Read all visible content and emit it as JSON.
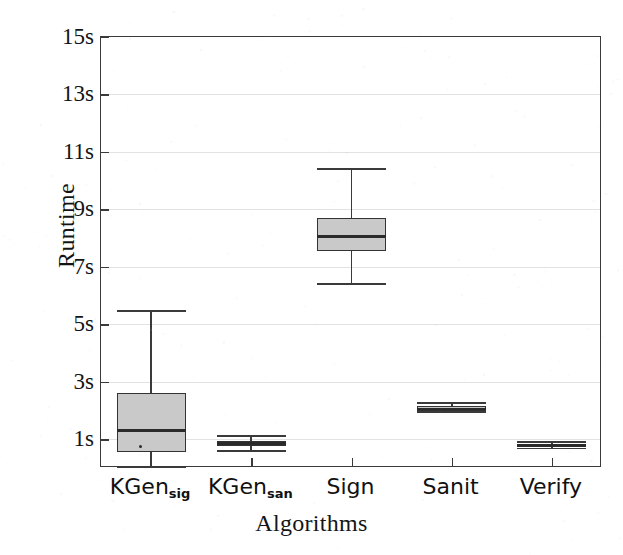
{
  "chart_data": {
    "type": "box",
    "title": "",
    "xlabel": "Algorithms",
    "ylabel": "Runtime",
    "categories": [
      "KGen_sig",
      "KGen_san",
      "Sign",
      "Sanit",
      "Verify"
    ],
    "category_labels": [
      {
        "base": "KGen",
        "sub": "sig"
      },
      {
        "base": "KGen",
        "sub": "san"
      },
      {
        "base": "Sign",
        "sub": ""
      },
      {
        "base": "Sanit",
        "sub": ""
      },
      {
        "base": "Verify",
        "sub": ""
      }
    ],
    "ylim": [
      0.0,
      15.0
    ],
    "yticks": [
      1,
      3,
      5,
      7,
      9,
      11,
      13,
      15
    ],
    "ytick_labels": [
      "1s",
      "3s",
      "5s",
      "7s",
      "9s",
      "11s",
      "13s",
      "15s"
    ],
    "grid": true,
    "legend": "none",
    "units": "seconds",
    "boxes": [
      {
        "category": "KGen_sig",
        "whisker_low": 0.05,
        "q1": 0.55,
        "median": 1.3,
        "q3": 2.6,
        "whisker_high": 5.45,
        "outliers": [
          0.75
        ]
      },
      {
        "category": "KGen_san",
        "whisker_low": 0.6,
        "q1": 0.75,
        "median": 0.85,
        "q3": 0.95,
        "whisker_high": 1.1,
        "outliers": []
      },
      {
        "category": "Sign",
        "whisker_low": 6.4,
        "q1": 7.55,
        "median": 8.05,
        "q3": 8.7,
        "whisker_high": 10.4,
        "outliers": []
      },
      {
        "category": "Sanit",
        "whisker_low": 1.95,
        "q1": 2.0,
        "median": 2.05,
        "q3": 2.15,
        "whisker_high": 2.25,
        "outliers": []
      },
      {
        "category": "Verify",
        "whisker_low": 0.68,
        "q1": 0.72,
        "median": 0.78,
        "q3": 0.84,
        "whisker_high": 0.9,
        "outliers": []
      }
    ],
    "colors": {
      "box_fill": "#c9c9c9",
      "box_edge": "#333333",
      "median": "#2a2a2a",
      "whisker": "#3a3a3a",
      "grid": "#e2e2e2",
      "axis": "#3a3a3a",
      "background": "#ffffff",
      "text": "#141414"
    }
  }
}
